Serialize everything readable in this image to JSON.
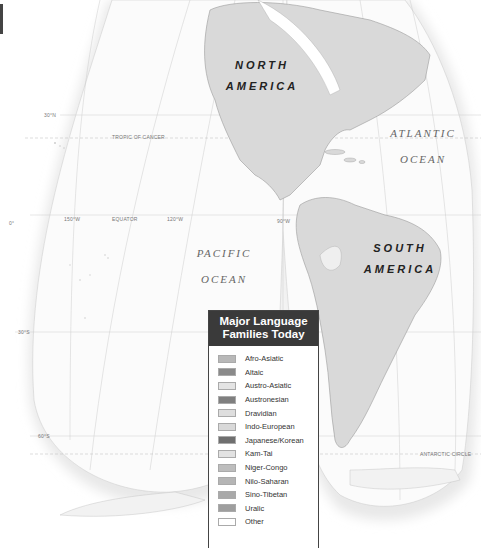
{
  "map": {
    "continents": [
      {
        "id": "north-america",
        "line1": "NORTH",
        "line2": "AMERICA"
      },
      {
        "id": "south-america",
        "line1": "SOUTH",
        "line2": "AMERICA"
      }
    ],
    "oceans": [
      {
        "id": "atlantic",
        "line1": "ATLANTIC",
        "line2": "OCEAN"
      },
      {
        "id": "pacific",
        "line1": "PACIFIC",
        "line2": "OCEAN"
      }
    ],
    "grid_labels": {
      "lat_30n": "30°N",
      "tropic_of_cancer": "TROPIC OF CANCER",
      "lat_0": "0°",
      "lon_150w": "150°W",
      "equator": "EQUATOR",
      "lon_120w": "120°W",
      "lon_90w": "90°W",
      "lat_30s": "30°S",
      "lat_60s": "60°S",
      "antarctic_circle": "ANTARCTIC CIRCLE"
    },
    "colors": {
      "land": "#d9d9d9",
      "land_border": "#9a9a9a",
      "ocean": "#ffffff",
      "grid": "#cccccc",
      "shadow": "#e6e6e6"
    }
  },
  "legend": {
    "title_line1": "Major Language",
    "title_line2": "Families Today",
    "items": [
      {
        "label": "Afro-Asiatic",
        "color": "#b8b8b8"
      },
      {
        "label": "Altaic",
        "color": "#8a8a8a"
      },
      {
        "label": "Austro-Asiatic",
        "color": "#e4e4e4"
      },
      {
        "label": "Austronesian",
        "color": "#7f7f7f"
      },
      {
        "label": "Dravidian",
        "color": "#dedede"
      },
      {
        "label": "Indo-European",
        "color": "#d9d9d9"
      },
      {
        "label": "Japanese/Korean",
        "color": "#6f6f6f"
      },
      {
        "label": "Kam-Tai",
        "color": "#e2e2e2"
      },
      {
        "label": "Niger-Congo",
        "color": "#bdbdbd"
      },
      {
        "label": "Nilo-Saharan",
        "color": "#b5b5b5"
      },
      {
        "label": "Sino-Tibetan",
        "color": "#a9a9a9"
      },
      {
        "label": "Uralic",
        "color": "#9e9e9e"
      },
      {
        "label": "Other",
        "color": "#ffffff"
      }
    ]
  }
}
